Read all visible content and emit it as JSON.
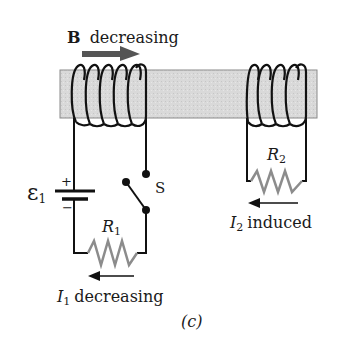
{
  "diagram": {
    "panel_label": "(c)",
    "field": {
      "symbol": "B",
      "text": "decreasing"
    },
    "emf": {
      "symbol": "ε",
      "subscript": "1",
      "plus": "+",
      "minus": "−"
    },
    "switch_label": "S",
    "resistor1": {
      "symbol": "R",
      "subscript": "1"
    },
    "resistor2": {
      "symbol": "R",
      "subscript": "2"
    },
    "current1": {
      "symbol": "I",
      "subscript": "1",
      "text": "decreasing"
    },
    "current2": {
      "symbol": "I",
      "subscript": "2",
      "text": "induced"
    },
    "colors": {
      "wire": "#111111",
      "core_fill": "#d8d8d8",
      "core_stroke": "#8a8a8a",
      "resistor": "#8c8c8c",
      "field_arrow": "#555555"
    }
  }
}
